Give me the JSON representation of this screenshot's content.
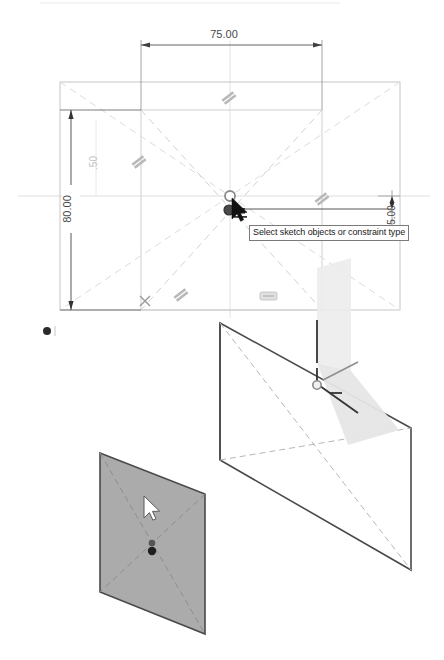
{
  "app": {
    "view_mode": "sketch-edit",
    "background_color": "#ffffff"
  },
  "tooltip": {
    "text": "Select sketch objects or constraint type",
    "border_color": "#7a7a7a",
    "background_color": "#ffffff"
  },
  "sketch_view": {
    "name": "2d-sketch-viewport",
    "outer_rectangle": {
      "label": "outer-construction-rectangle",
      "color": "#c8c8c8"
    },
    "inner_rectangle": {
      "label": "inner-sketch-rectangle",
      "color": "#c8c8c8"
    },
    "dimensions": [
      {
        "name": "horizontal-dimension",
        "value": "75.00",
        "orientation": "horizontal",
        "color": "#555555"
      },
      {
        "name": "vertical-dimension",
        "value": "80.00",
        "orientation": "vertical",
        "color": "#444444"
      },
      {
        "name": "offset-dimension-faint",
        "value": ".50",
        "orientation": "vertical",
        "color": "#c2c2c2"
      },
      {
        "name": "right-offset-dimension",
        "value": "5.00",
        "orientation": "vertical",
        "color": "#444444"
      }
    ],
    "constraint_glyphs": [
      {
        "name": "parallel-constraint-top",
        "symbol": "//"
      },
      {
        "name": "parallel-constraint-left",
        "symbol": "//"
      },
      {
        "name": "parallel-constraint-right",
        "symbol": "//"
      },
      {
        "name": "parallel-constraint-bottom",
        "symbol": "//"
      },
      {
        "name": "fix-constraint-bottom-left",
        "symbol": "x"
      },
      {
        "name": "horizontal-constraint-badge",
        "symbol": "="
      }
    ],
    "origin_point": {
      "name": "sketch-origin",
      "color": "#888888"
    },
    "selected_point": {
      "name": "selected-sketch-point",
      "color": "#3a3a3a"
    },
    "cursor": {
      "name": "mouse-cursor-arrow",
      "color": "#1a1a1a"
    },
    "diagonal_lines_color": "#d8d8d8",
    "centerline_color": "#d0d0d0"
  },
  "model_view": {
    "name": "3d-model-viewport",
    "planes": [
      {
        "name": "reference-plane-large",
        "fill": "none",
        "stroke": "#4a4a4a",
        "style": "wireframe"
      },
      {
        "name": "sketch-plane-translucent",
        "fill": "#e8e8e8",
        "stroke": "none",
        "style": "translucent"
      },
      {
        "name": "selected-plane-shaded",
        "fill": "#ababab",
        "stroke": "#4a4a4a",
        "style": "shaded"
      }
    ],
    "origin_marker": {
      "name": "model-origin-point",
      "color": "#8a8a8a"
    },
    "axis_lines_color": "#333333",
    "hidden_edge_color": "#b0b0b0",
    "cursor": {
      "name": "mouse-cursor-arrow-3d",
      "fill": "#ffffff",
      "stroke": "#3a3a3a"
    },
    "point_marker": {
      "name": "plane-center-point",
      "color": "#1f1f1f"
    }
  },
  "legend_marker": {
    "name": "status-dot-marker",
    "color": "#2b2b2b"
  }
}
